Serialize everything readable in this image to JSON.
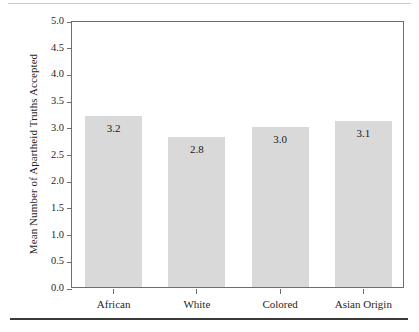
{
  "figure": {
    "name": "apartheid-truths-bar-chart"
  },
  "chart_data": {
    "type": "bar",
    "title": "",
    "subtitle": "",
    "xlabel": "",
    "ylabel": "Mean Number of Apartheid Truths Accepted",
    "categories": [
      "African",
      "White",
      "Colored",
      "Asian Origin"
    ],
    "values": [
      3.2,
      2.8,
      3.0,
      3.1
    ],
    "value_labels": [
      "3.2",
      "2.8",
      "3.0",
      "3.1"
    ],
    "ylim": [
      0.0,
      5.0
    ],
    "ytick_values": [
      0.0,
      0.5,
      1.0,
      1.5,
      2.0,
      2.5,
      3.0,
      3.5,
      4.0,
      4.5,
      5.0
    ],
    "ytick_labels": [
      "0.0",
      "0.5",
      "1.0",
      "1.5",
      "2.0",
      "2.5",
      "3.0",
      "3.5",
      "4.0",
      "4.5",
      "5.0"
    ],
    "grid": false,
    "legend": false,
    "legend_position": "none",
    "bar_color": "#d9d9d9",
    "axis_color": "#6e6e6e",
    "text_color": "#1f1f1f"
  }
}
